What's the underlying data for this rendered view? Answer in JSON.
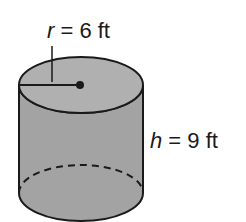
{
  "figure": {
    "shape": "cylinder",
    "radius_label": {
      "variable": "r",
      "rest": " = 6 ft"
    },
    "height_label": {
      "variable": "h",
      "rest": " = 9 ft"
    },
    "colors": {
      "fill": "#a3a3a3",
      "top_fill": "#b0b0b0",
      "stroke": "#1a1a1a",
      "background": "#ffffff"
    }
  }
}
